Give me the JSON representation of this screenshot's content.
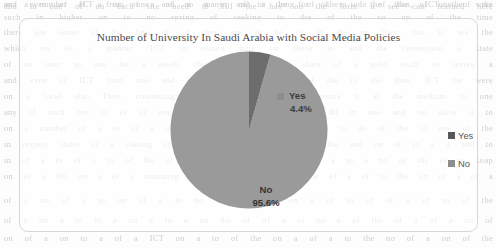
{
  "page": {
    "background_color": "#fdfdfd",
    "bleed_text_color": "#cfcfcf",
    "bleed_lines": [
      "and in one of on each site need to fill the has on the form it see can learned here",
      "such in higher on to no spring of seeking to the of the so up of the time",
      "there are some of the line of of they are to be of in the on their this to are the",
      "which on its a manner. ICT to ensure note on these to and the connection a state",
      "of an inter to one for a needs, that they and they share of a solid study to review a",
      "and even of ICT from one and a many and a long of the to the than, ICT the were",
      "on a local also They, continuing students of the to to ensure it at the medium to one",
      "any of such one to of of one of the of the on, in of 40 in one and on show it to",
      "on a number of a to of a of no a in of to the for of to do of the of one of the",
      "in respect under of a sharing of to a of a of of the of the and on of to a  2 and to",
      "in of a to of a to of the of a to of to the of to of a to a no of the of to  soap",
      "on of a 4% on a of a mounting of to a of a to of the of a of to the on of a of a",
      "of a on of a to on of a to no a of a of on a of to of of a of to of the",
      "of a on a to in a on a to a on the of of a to no a of the of a of a on of",
      "on of a on to a of a ICT on a to of the on a of a to the no of a on of the"
    ]
  },
  "chart": {
    "title": "Number of University In Saudi Arabia with Social Media Policies",
    "frame": {
      "border_color": "#d7d7d7",
      "border_radius_px": 9
    },
    "legend": {
      "position": "right",
      "items": [
        {
          "label": "Yes",
          "color": "#585858",
          "swatch_name": "legend-swatch-yes"
        },
        {
          "label": "No",
          "color": "#8d8d8d",
          "swatch_name": "legend-swatch-no"
        }
      ]
    },
    "callouts": {
      "yes": {
        "label": "Yes",
        "value_label": "4.4%",
        "swatch_color": "#8d8d8d"
      },
      "no": {
        "label": "No",
        "value_label": "95.6%"
      }
    }
  },
  "chart_data": {
    "type": "pie",
    "title": "Number of University In Saudi Arabia with Social Media Policies",
    "xlabel": "",
    "ylabel": "",
    "categories": [
      "Yes",
      "No"
    ],
    "values": [
      4.4,
      95.6
    ],
    "value_unit": "percent",
    "data_labels": [
      "4.4%",
      "95.6%"
    ],
    "colors": [
      "#6d6d6d",
      "#9a9a9a"
    ],
    "start_angle_deg": 90,
    "direction": "clockwise",
    "legend": {
      "entries": [
        "Yes",
        "No"
      ],
      "position": "right"
    },
    "grid": false,
    "series": [
      {
        "name": "Number of University In Saudi Arabia with Social Media Policies",
        "values": [
          4.4,
          95.6
        ]
      }
    ]
  }
}
